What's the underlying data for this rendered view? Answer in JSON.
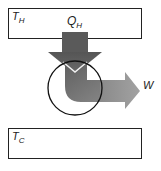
{
  "diagram": {
    "type": "heat-engine",
    "hot_reservoir": {
      "symbol": "T",
      "subscript": "H"
    },
    "cold_reservoir": {
      "symbol": "T",
      "subscript": "C"
    },
    "heat_in": {
      "symbol": "Q",
      "subscript": "H"
    },
    "work_out": {
      "symbol": "W"
    },
    "colors": {
      "arrow_dark": "#5a5a5a",
      "arrow_light": "#9a9a9a",
      "outline": "#222222"
    }
  }
}
